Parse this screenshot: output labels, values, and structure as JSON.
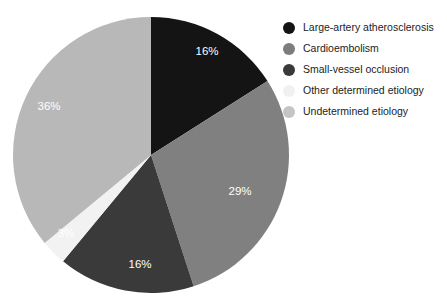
{
  "chart_data": {
    "type": "pie",
    "title": "",
    "subtitle": "",
    "xlabel": "",
    "ylabel": "",
    "legend_position": "right",
    "grid": false,
    "start_angle_deg": 0,
    "direction": "clockwise",
    "categories": [
      "Large-artery atherosclerosis",
      "Cardioembolism",
      "Small-vessel occlusion",
      "Other determined etiology",
      "Undetermined etiology"
    ],
    "values": [
      16,
      29,
      16,
      3,
      36
    ],
    "value_labels": [
      "16%",
      "29%",
      "16%",
      "3%",
      "36%"
    ],
    "colors": [
      "#141414",
      "#808080",
      "#3a3a3a",
      "#f2f2f2",
      "#b8b8b8"
    ],
    "label_colors": [
      "#ffffff",
      "#ffffff",
      "#ffffff",
      "#4a4a4a",
      "#ffffff"
    ],
    "slices": [
      {
        "name": "Large-artery atherosclerosis",
        "value": 16,
        "label": "16%",
        "color": "#141414",
        "label_color": "#ffffff",
        "label_x": 207,
        "label_y": 52
      },
      {
        "name": "Cardioembolism",
        "value": 29,
        "label": "29%",
        "color": "#808080",
        "label_color": "#ffffff",
        "label_x": 240,
        "label_y": 192
      },
      {
        "name": "Small-vessel occlusion",
        "value": 16,
        "label": "16%",
        "color": "#3a3a3a",
        "label_color": "#ffffff",
        "label_x": 140,
        "label_y": 265
      },
      {
        "name": "Other determined etiology",
        "value": 3,
        "label": "3%",
        "color": "#f2f2f2",
        "label_color": "#4a4a4a",
        "label_x": 66,
        "label_y": 234
      },
      {
        "name": "Undetermined etiology",
        "value": 36,
        "label": "36%",
        "color": "#b8b8b8",
        "label_color": "#ffffff",
        "label_x": 49,
        "label_y": 107
      }
    ],
    "geometry": {
      "center_x": 151,
      "center_y": 155,
      "radius": 138
    }
  },
  "legend": {
    "items": [
      {
        "label": "Large-artery atherosclerosis",
        "color": "#141414",
        "swatch": "circle-swatch"
      },
      {
        "label": "Cardioembolism",
        "color": "#7d7d7d",
        "swatch": "circle-swatch"
      },
      {
        "label": "Small-vessel occlusion",
        "color": "#3a3a3a",
        "swatch": "circle-swatch"
      },
      {
        "label": "Other determined etiology",
        "color": "#f1f1f1",
        "swatch": "circle-swatch"
      },
      {
        "label": "Undetermined etiology",
        "color": "#c4c4c4",
        "swatch": "circle-swatch"
      }
    ]
  }
}
